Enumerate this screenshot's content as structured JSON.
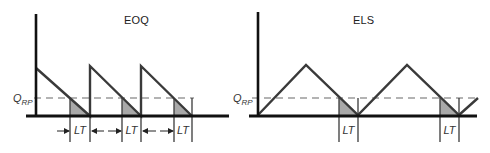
{
  "colors": {
    "axis": "#111111",
    "line": "#3a3a3a",
    "dashed": "#9a9a9a",
    "shade": "#a9a9a9",
    "text": "#333333"
  },
  "panels": [
    {
      "id": "eoq",
      "title": "EOQ",
      "title_pos": [
        124,
        14
      ],
      "reorder_point_label": {
        "main": "Q",
        "sub": "RP",
        "pos": [
          13,
          92
        ]
      },
      "axis": {
        "x": 36,
        "top": 14,
        "baseline_y": 116,
        "baseline_x0": 26,
        "baseline_x1": 229
      },
      "reorder_line": {
        "y": 98,
        "x0": 34,
        "x1": 194
      },
      "profile": [
        [
          36,
          68
        ],
        [
          90,
          116
        ],
        [
          90,
          66
        ],
        [
          141,
          116
        ],
        [
          141,
          66
        ],
        [
          192,
          116
        ]
      ],
      "shaded": [
        [
          [
            70,
            98
          ],
          [
            90,
            116
          ],
          [
            70,
            116
          ]
        ],
        [
          [
            122,
            98
          ],
          [
            141,
            116
          ],
          [
            122,
            116
          ]
        ],
        [
          [
            174,
            98
          ],
          [
            192,
            116
          ],
          [
            174,
            116
          ]
        ]
      ],
      "lead_time_ticks": [
        {
          "x0": 70,
          "x1": 90,
          "y0": 98,
          "y1": 142,
          "label": "LT"
        },
        {
          "x0": 122,
          "x1": 141,
          "y0": 98,
          "y1": 142,
          "label": "LT"
        },
        {
          "x0": 174,
          "x1": 192,
          "y0": 98,
          "y1": 142,
          "label": "LT"
        }
      ],
      "arrows": [
        {
          "from": [
            57,
            131
          ],
          "to": [
            69,
            131
          ]
        },
        {
          "from": [
            104,
            131
          ],
          "to": [
            92,
            131
          ]
        },
        {
          "from": [
            108,
            131
          ],
          "to": [
            121,
            131
          ]
        },
        {
          "from": [
            156,
            131
          ],
          "to": [
            143,
            131
          ]
        },
        {
          "from": [
            160,
            131
          ],
          "to": [
            173,
            131
          ]
        }
      ]
    },
    {
      "id": "els",
      "title": "ELS",
      "title_pos": [
        353,
        14
      ],
      "reorder_point_label": {
        "main": "Q",
        "sub": "RP",
        "pos": [
          233,
          92
        ]
      },
      "axis": {
        "x": 258,
        "top": 12,
        "baseline_y": 116,
        "baseline_x0": 249,
        "baseline_x1": 477
      },
      "reorder_line": {
        "y": 98,
        "x0": 252,
        "x1": 478
      },
      "profile": [
        [
          258,
          115
        ],
        [
          306,
          65
        ],
        [
          358,
          115
        ],
        [
          407,
          65
        ],
        [
          459,
          115
        ],
        [
          478,
          98
        ]
      ],
      "shaded": [
        [
          [
            339,
            98
          ],
          [
            358,
            116
          ],
          [
            339,
            116
          ]
        ],
        [
          [
            440,
            98
          ],
          [
            459,
            116
          ],
          [
            440,
            116
          ]
        ]
      ],
      "lead_time_ticks": [
        {
          "x0": 339,
          "x1": 358,
          "y0": 98,
          "y1": 142,
          "label": "LT"
        },
        {
          "x0": 440,
          "x1": 459,
          "y0": 98,
          "y1": 142,
          "label": "LT"
        }
      ],
      "arrows": []
    }
  ]
}
